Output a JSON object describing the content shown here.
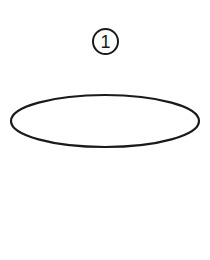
{
  "diagram": {
    "label_number": "1",
    "shape": "ellipse",
    "stroke_color": "#1a1a1a",
    "fill_color": "#ffffff"
  }
}
